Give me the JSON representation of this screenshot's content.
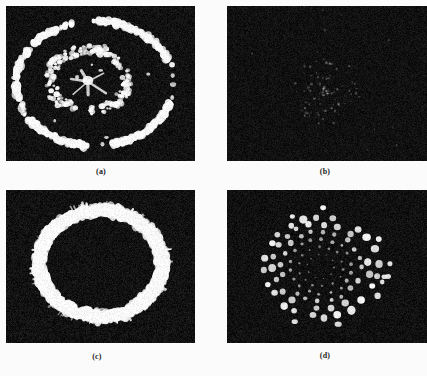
{
  "figure": {
    "kind": "scanned-figure-plate",
    "background_color": "#fbfbfb",
    "panel_background_color": "#0a0a0a",
    "speckle_color": "#f2f2f2",
    "width": 427,
    "height": 376,
    "panels": [
      {
        "id": "panel-a",
        "caption": "(a)",
        "x": 6,
        "y": 6,
        "width": 189,
        "height": 155,
        "caption_x": 81,
        "caption_y": 167,
        "description": "broken speckled arc ring with irregular inner blob cluster",
        "pattern": "arc-ring-with-core",
        "brightness": "high",
        "center_x": 0.47,
        "center_y": 0.5,
        "outer_radius_x": 0.27,
        "outer_radius_y": 0.36
      },
      {
        "id": "panel-b",
        "caption": "(b)",
        "x": 227,
        "y": 6,
        "width": 200,
        "height": 155,
        "caption_x": 305,
        "caption_y": 167,
        "description": "almost entirely dark field with a few very faint specks",
        "pattern": "near-empty-field",
        "brightness": "very-low",
        "center_x": 0.5,
        "center_y": 0.55,
        "outer_radius_x": 0.16,
        "outer_radius_y": 0.2
      },
      {
        "id": "panel-c",
        "caption": "(c)",
        "x": 6,
        "y": 190,
        "width": 189,
        "height": 153,
        "caption_x": 77,
        "caption_y": 352,
        "description": "thick bright speckled elliptical ring with dark interior",
        "pattern": "speckle-ring",
        "brightness": "high",
        "center_x": 0.5,
        "center_y": 0.48,
        "outer_radius_x": 0.24,
        "outer_radius_y": 0.33
      },
      {
        "id": "panel-d",
        "caption": "(d)",
        "x": 227,
        "y": 190,
        "width": 200,
        "height": 153,
        "caption_x": 305,
        "caption_y": 351,
        "description": "radial spiral arrangement of discrete round bright dots around a dark core",
        "pattern": "dot-spiral",
        "brightness": "high",
        "center_x": 0.47,
        "center_y": 0.5,
        "outer_radius_x": 0.22,
        "outer_radius_y": 0.34
      }
    ]
  }
}
